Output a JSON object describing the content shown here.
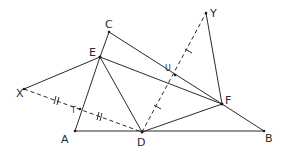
{
  "diagram": {
    "type": "geometry",
    "points": {
      "A": {
        "label": "A",
        "x": 75,
        "y": 131
      },
      "B": {
        "label": "B",
        "x": 264,
        "y": 131
      },
      "C": {
        "label": "C",
        "x": 109,
        "y": 32
      },
      "D": {
        "label": "D",
        "x": 142,
        "y": 132
      },
      "E": {
        "label": "E",
        "x": 100,
        "y": 57
      },
      "F": {
        "label": "F",
        "x": 222,
        "y": 104
      },
      "X": {
        "label": "X",
        "x": 24,
        "y": 89
      },
      "Y": {
        "label": "Y",
        "x": 206,
        "y": 13
      },
      "T": {
        "label": "T",
        "x": 80,
        "y": 109
      },
      "U": {
        "label": "U",
        "x": 175,
        "y": 75
      }
    },
    "solid_segments": [
      "CE",
      "CF",
      "EA",
      "EX",
      "ED",
      "EF",
      "AB",
      "DF",
      "FB",
      "YF"
    ],
    "dashed_segments": [
      "XD",
      "DY"
    ],
    "equal_marks": [
      {
        "segments": [
          "XT",
          "TD"
        ],
        "marks": 2
      },
      {
        "segments": [
          "DU",
          "UY"
        ],
        "marks": 1
      }
    ]
  }
}
